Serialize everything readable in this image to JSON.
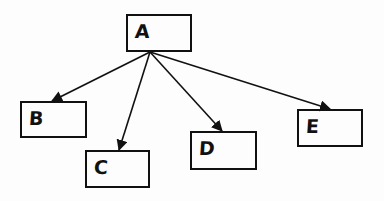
{
  "diagram": {
    "type": "tree",
    "stroke_color": "#111111",
    "background": "#ffffff",
    "nodes": [
      {
        "id": "A",
        "label": "A",
        "x": 126,
        "y": 14,
        "w": 66,
        "h": 38
      },
      {
        "id": "B",
        "label": "B",
        "x": 20,
        "y": 101,
        "w": 67,
        "h": 37
      },
      {
        "id": "C",
        "label": "C",
        "x": 85,
        "y": 150,
        "w": 65,
        "h": 38
      },
      {
        "id": "D",
        "label": "D",
        "x": 190,
        "y": 131,
        "w": 67,
        "h": 39
      },
      {
        "id": "E",
        "label": "E",
        "x": 297,
        "y": 109,
        "w": 66,
        "h": 38
      }
    ],
    "edges": [
      {
        "from": "A",
        "to": "B",
        "x1": 150,
        "y1": 52,
        "x2": 52,
        "y2": 101
      },
      {
        "from": "A",
        "to": "C",
        "x1": 150,
        "y1": 52,
        "x2": 119,
        "y2": 150
      },
      {
        "from": "A",
        "to": "D",
        "x1": 150,
        "y1": 52,
        "x2": 222,
        "y2": 131
      },
      {
        "from": "A",
        "to": "E",
        "x1": 150,
        "y1": 52,
        "x2": 330,
        "y2": 109
      }
    ]
  }
}
